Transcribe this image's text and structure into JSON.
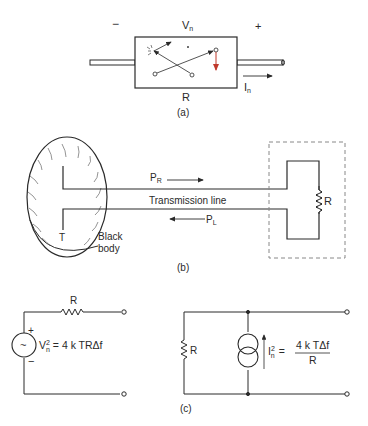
{
  "figure_a": {
    "minus_sign": "−",
    "plus_sign": "+",
    "voltage_label": "V",
    "voltage_sub": "n",
    "resistor_label": "R",
    "current_label": "I",
    "current_sub": "n",
    "caption": "(a)"
  },
  "figure_b": {
    "power_right": "P",
    "power_right_sub": "R",
    "power_left": "P",
    "power_left_sub": "L",
    "line_label": "Transmission line",
    "temperature_label": "T",
    "body_label_1": "Black",
    "body_label_2": "body",
    "resistor_label": "R",
    "caption": "(b)"
  },
  "figure_c": {
    "series_resistor_label": "R",
    "plus_sign": "+",
    "minus_sign": "−",
    "source_symbol": "~",
    "voltage_eq_lhs": "V",
    "voltage_eq_sup": "2",
    "voltage_eq_sub": "n",
    "voltage_eq_rhs": "= 4 k TRΔf",
    "shunt_resistor_label": "R",
    "current_eq_lhs": "I",
    "current_eq_sup": "2",
    "current_eq_sub": "n",
    "current_eq_equals": "=",
    "current_eq_numerator": "4 k TΔf",
    "current_eq_denominator": "R",
    "caption": "(c)"
  },
  "colors": {
    "line": "#2a2a2a",
    "arrow_red": "#c0392b",
    "dash": "#888888"
  }
}
